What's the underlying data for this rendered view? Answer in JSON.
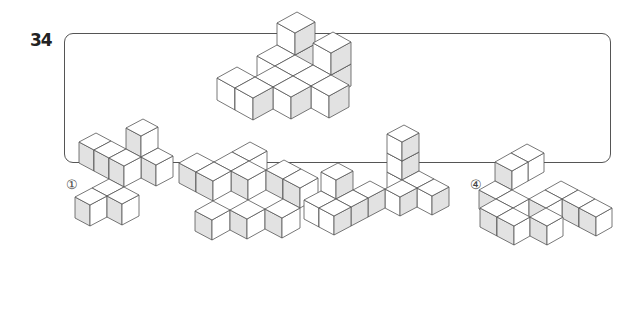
{
  "question": {
    "number": "34",
    "stem_figure": "cube-block-figure",
    "colors": {
      "light_face": "#ffffff",
      "shaded_face": "#e2e2e2",
      "edge": "#555555",
      "border": "#555555"
    }
  },
  "choices": [
    {
      "label": "①",
      "figure": "choice-1-cube-figure"
    },
    {
      "label": "②",
      "figure": "choice-2-cube-figure"
    },
    {
      "label": "③",
      "figure": "choice-3-cube-figure"
    },
    {
      "label": "④",
      "figure": "choice-4-cube-figure"
    }
  ]
}
